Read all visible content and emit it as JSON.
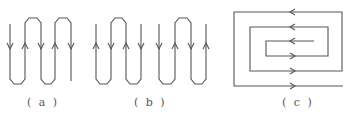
{
  "figure": {
    "stroke_color": "#555555",
    "panels": [
      {
        "id": "a",
        "label": "( a )",
        "description": "Single serpentine (meander) path with five vertical segments",
        "segment_x": [
          10,
          25,
          41,
          55,
          71
        ],
        "arrows": [
          "down",
          "up",
          "down",
          "up",
          "down"
        ]
      },
      {
        "id": "b",
        "label": "( b )",
        "description": "Two separate serpentine paths, each with four vertical segments",
        "groups": [
          {
            "segment_x": [
              96,
              111,
              126,
              141
            ],
            "arrows": [
              "up",
              "down",
              "up",
              "down"
            ]
          },
          {
            "segment_x": [
              159,
              175,
              191,
              206
            ],
            "arrows": [
              "down",
              "up",
              "down",
              "up"
            ]
          }
        ]
      },
      {
        "id": "c",
        "label": "( c )",
        "description": "Rectangular spiral path",
        "arrows": [
          "left",
          "left",
          "left",
          "right",
          "right",
          "right"
        ]
      }
    ]
  }
}
